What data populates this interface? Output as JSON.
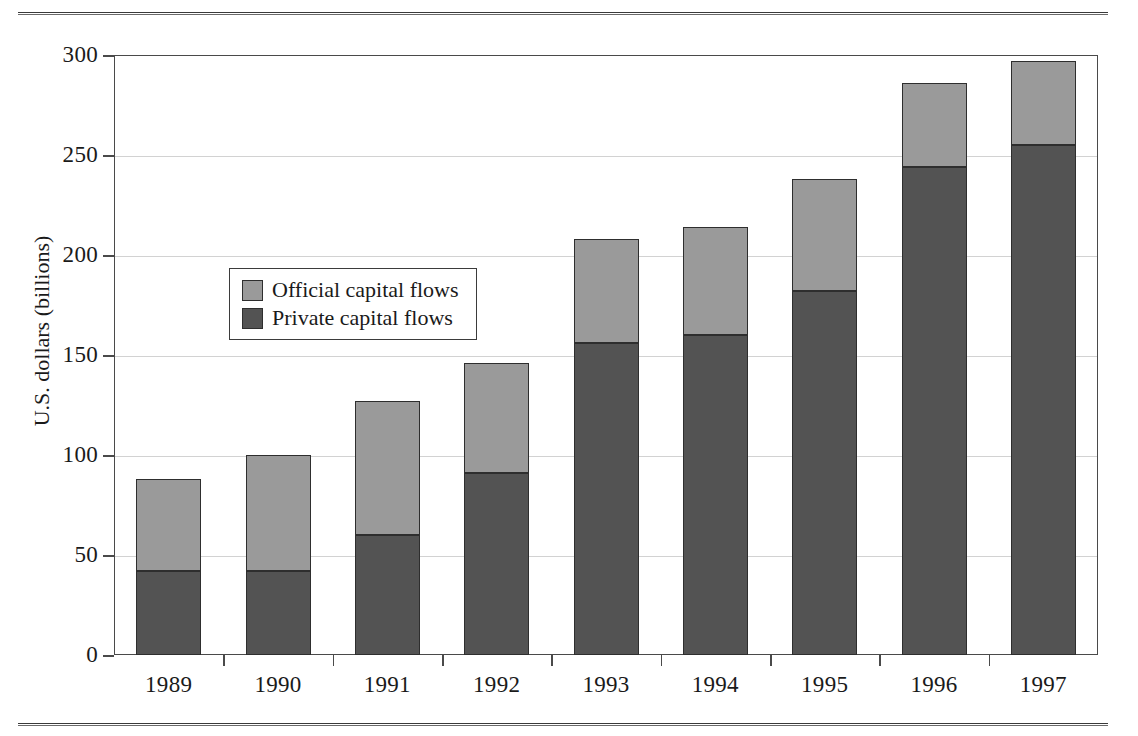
{
  "figure": {
    "cropped_top_caption": "",
    "y_axis_title": "U.S. dollars (billions)"
  },
  "legend": {
    "items": [
      {
        "label": "Official capital flows",
        "key": "official",
        "color": "#9a9a9a"
      },
      {
        "label": "Private capital flows",
        "key": "private",
        "color": "#535353"
      }
    ]
  },
  "chart_data": {
    "type": "bar",
    "stacked": true,
    "title": "",
    "xlabel": "",
    "ylabel": "U.S. dollars (billions)",
    "ylim": [
      0,
      300
    ],
    "yticks": [
      0,
      50,
      100,
      150,
      200,
      250,
      300
    ],
    "ytick_labels": [
      "0",
      "50",
      "100",
      "150",
      "200",
      "250",
      "300"
    ],
    "grid": true,
    "grid_axis": "y",
    "legend_position": "inside-upper-left",
    "categories": [
      "1989",
      "1990",
      "1991",
      "1992",
      "1993",
      "1994",
      "1995",
      "1996",
      "1997"
    ],
    "series": [
      {
        "name": "Private capital flows",
        "color": "#535353",
        "values": [
          42,
          42,
          60,
          91,
          156,
          160,
          182,
          244,
          255
        ]
      },
      {
        "name": "Official capital flows",
        "color": "#9a9a9a",
        "values": [
          46,
          58,
          67,
          55,
          52,
          54,
          56,
          42,
          42
        ]
      }
    ],
    "totals": [
      88,
      100,
      127,
      146,
      208,
      214,
      238,
      286,
      297
    ]
  }
}
